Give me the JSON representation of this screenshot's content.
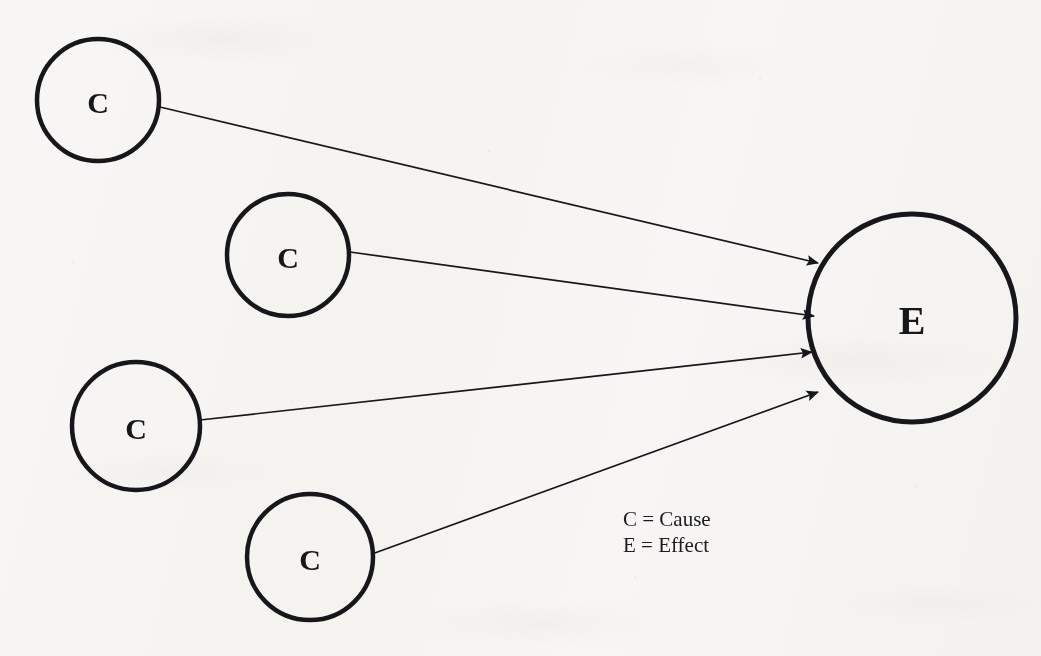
{
  "diagram": {
    "type": "cause-effect",
    "background_color": "#f6f5f3",
    "ink_color": "#17161a",
    "nodes": [
      {
        "id": "cause-1",
        "label": "C",
        "role": "cause",
        "cx": 98,
        "cy": 100,
        "r": 61,
        "stroke_width": 4.5,
        "font_size": 30
      },
      {
        "id": "cause-2",
        "label": "C",
        "role": "cause",
        "cx": 288,
        "cy": 255,
        "r": 61,
        "stroke_width": 4.5,
        "font_size": 30
      },
      {
        "id": "cause-3",
        "label": "C",
        "role": "cause",
        "cx": 136,
        "cy": 426,
        "r": 64,
        "stroke_width": 4.5,
        "font_size": 30
      },
      {
        "id": "cause-4",
        "label": "C",
        "role": "cause",
        "cx": 310,
        "cy": 557,
        "r": 63,
        "stroke_width": 4.5,
        "font_size": 30
      },
      {
        "id": "effect",
        "label": "E",
        "role": "effect",
        "cx": 912,
        "cy": 318,
        "r": 104,
        "stroke_width": 5.0,
        "font_size": 40
      }
    ],
    "edges": [
      {
        "id": "edge-1",
        "from": "cause-1",
        "to": "effect",
        "x1": 160,
        "y1": 107,
        "x2": 818,
        "y2": 263,
        "stroke_width": 1.7
      },
      {
        "id": "edge-2",
        "from": "cause-2",
        "to": "effect",
        "x1": 350,
        "y1": 252,
        "x2": 814,
        "y2": 316,
        "stroke_width": 1.7
      },
      {
        "id": "edge-3",
        "from": "cause-3",
        "to": "effect",
        "x1": 200,
        "y1": 420,
        "x2": 812,
        "y2": 352,
        "stroke_width": 1.7
      },
      {
        "id": "edge-4",
        "from": "cause-4",
        "to": "effect",
        "x1": 372,
        "y1": 554,
        "x2": 818,
        "y2": 392,
        "stroke_width": 1.7
      }
    ],
    "legend": {
      "x": 623,
      "lines": [
        {
          "id": "legend-cause",
          "text": "C = Cause",
          "y": 526
        },
        {
          "id": "legend-effect",
          "text": "E = Effect",
          "y": 552
        }
      ]
    }
  }
}
